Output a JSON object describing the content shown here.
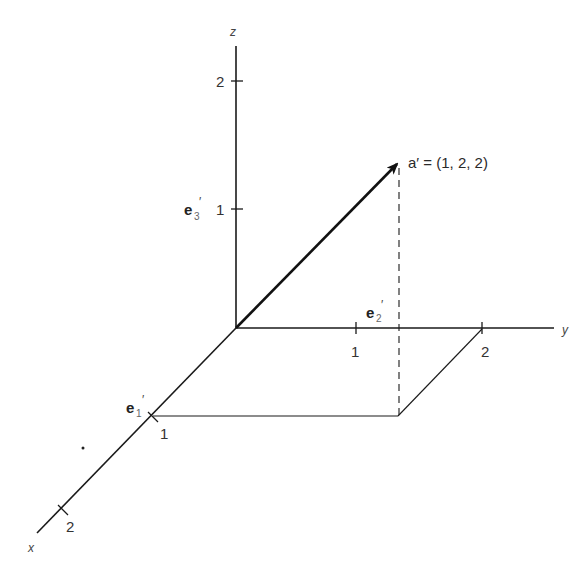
{
  "diagram": {
    "type": "3d-coordinate-vector",
    "axes": {
      "x": {
        "label": "x",
        "ticks": [
          "1",
          "2"
        ]
      },
      "y": {
        "label": "y",
        "ticks": [
          "1",
          "2"
        ]
      },
      "z": {
        "label": "z",
        "ticks": [
          "1",
          "2"
        ]
      }
    },
    "basis_vectors": {
      "e1": {
        "base": "e",
        "sub": "1",
        "prime": "′"
      },
      "e2": {
        "base": "e",
        "sub": "2",
        "prime": "′"
      },
      "e3": {
        "base": "e",
        "sub": "3",
        "prime": "′"
      }
    },
    "vector": {
      "name": "a′",
      "label": "a′ = (1, 2, 2)",
      "components": [
        1,
        2,
        2
      ]
    },
    "colors": {
      "line": "#1a1a1a",
      "background": "#ffffff"
    }
  }
}
